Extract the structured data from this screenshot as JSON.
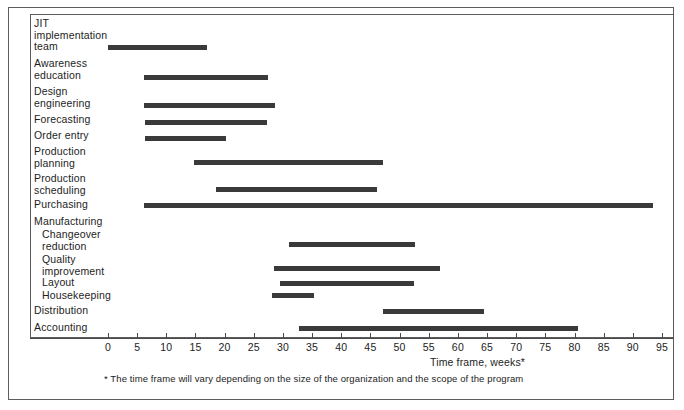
{
  "chart_data": {
    "type": "bar",
    "orientation": "horizontal",
    "subtype": "gantt",
    "title": "",
    "xlabel": "Time frame, weeks*",
    "ylabel": "",
    "xlim": [
      0,
      95
    ],
    "xticks": [
      0,
      5,
      10,
      15,
      20,
      25,
      30,
      35,
      40,
      45,
      50,
      55,
      60,
      65,
      70,
      75,
      80,
      85,
      90,
      95
    ],
    "grid": false,
    "legend": null,
    "bar_color": "#3a3a3a",
    "footnote": "* The time frame will vary depending on the size of the organization and  the scope of the program",
    "categories": [
      "JIT\nimplementation\nteam",
      "Awareness\neducation",
      "Design\nengineering",
      "Forecasting",
      "Order entry",
      "Production\nplanning",
      "Production\nscheduling",
      "Purchasing",
      "Manufacturing",
      "Changeover\nreduction",
      "Quality\nimprovement",
      "Layout",
      "Housekeeping",
      "Distribution",
      "Accounting"
    ],
    "tasks": [
      {
        "label": "JIT\nimplementation\nteam",
        "indent": 0,
        "start": 0,
        "end": 17,
        "has_bar": true,
        "label_top": 18,
        "bar_top": 45
      },
      {
        "label": "Awareness\neducation",
        "indent": 0,
        "start": 6.2,
        "end": 27.5,
        "has_bar": true,
        "label_top": 58,
        "bar_top": 75
      },
      {
        "label": "Design\nengineering",
        "indent": 0,
        "start": 6.2,
        "end": 28.6,
        "has_bar": true,
        "label_top": 86,
        "bar_top": 103
      },
      {
        "label": "Forecasting",
        "indent": 0,
        "start": 6.3,
        "end": 27.2,
        "has_bar": true,
        "label_top": 114,
        "bar_top": 120
      },
      {
        "label": "Order entry",
        "indent": 0,
        "start": 6.4,
        "end": 20.3,
        "has_bar": true,
        "label_top": 130,
        "bar_top": 136
      },
      {
        "label": "Production\nplanning",
        "indent": 0,
        "start": 14.7,
        "end": 47.2,
        "has_bar": true,
        "label_top": 146,
        "bar_top": 160
      },
      {
        "label": "Production\nscheduling",
        "indent": 0,
        "start": 18.5,
        "end": 46.2,
        "has_bar": true,
        "label_top": 173,
        "bar_top": 187
      },
      {
        "label": "Purchasing",
        "indent": 0,
        "start": 6.2,
        "end": 93.5,
        "has_bar": true,
        "label_top": 199,
        "bar_top": 203
      },
      {
        "label": "Manufacturing",
        "indent": 0,
        "start": null,
        "end": null,
        "has_bar": false,
        "label_top": 216,
        "bar_top": null
      },
      {
        "label": "Changeover\nreduction",
        "indent": 1,
        "start": 31.0,
        "end": 52.6,
        "has_bar": true,
        "label_top": 229,
        "bar_top": 242
      },
      {
        "label": "Quality\nimprovement",
        "indent": 1,
        "start": 28.5,
        "end": 57.0,
        "has_bar": true,
        "label_top": 254,
        "bar_top": 266
      },
      {
        "label": "Layout",
        "indent": 1,
        "start": 29.5,
        "end": 52.4,
        "has_bar": true,
        "label_top": 277,
        "bar_top": 281
      },
      {
        "label": "Housekeeping",
        "indent": 1,
        "start": 28.2,
        "end": 35.3,
        "has_bar": true,
        "label_top": 290,
        "bar_top": 293
      },
      {
        "label": "Distribution",
        "indent": 0,
        "start": 47.2,
        "end": 64.5,
        "has_bar": true,
        "label_top": 305,
        "bar_top": 309
      },
      {
        "label": "Accounting",
        "indent": 0,
        "start": 32.7,
        "end": 80.6,
        "has_bar": true,
        "label_top": 322,
        "bar_top": 326
      }
    ]
  }
}
